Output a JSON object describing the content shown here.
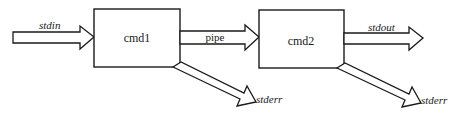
{
  "diagram": {
    "title": "",
    "nodes": [
      {
        "id": "cmd1",
        "label": "cmd1"
      },
      {
        "id": "cmd2",
        "label": "cmd2"
      }
    ],
    "edges": [
      {
        "id": "stdin",
        "from": "",
        "to": "cmd1",
        "label": "stdin"
      },
      {
        "id": "pipe",
        "from": "cmd1",
        "to": "cmd2",
        "label": "pipe"
      },
      {
        "id": "stderr1",
        "from": "cmd1",
        "to": "",
        "label": "stderr"
      },
      {
        "id": "stdout",
        "from": "cmd2",
        "to": "",
        "label": "stdout"
      },
      {
        "id": "stderr2",
        "from": "cmd2",
        "to": "",
        "label": "stderr"
      }
    ],
    "colors": {
      "stroke": "#1a1a1a",
      "background": "#ffffff"
    }
  }
}
